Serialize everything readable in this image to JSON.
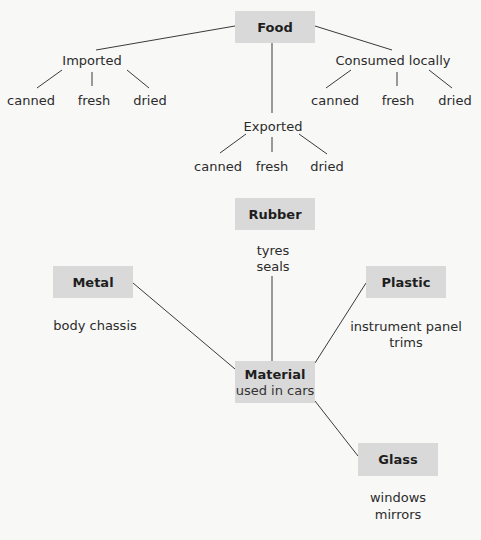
{
  "food_tree": {
    "root": "Food",
    "branches": [
      {
        "label": "Imported",
        "children": [
          "canned",
          "fresh",
          "dried"
        ]
      },
      {
        "label": "Exported",
        "children": [
          "canned",
          "fresh",
          "dried"
        ]
      },
      {
        "label": "Consumed locally",
        "children": [
          "canned",
          "fresh",
          "dried"
        ]
      }
    ]
  },
  "materials_map": {
    "center": {
      "title": "Material",
      "subtitle": "used in cars"
    },
    "nodes": [
      {
        "title": "Rubber",
        "items": [
          "tyres",
          "seals"
        ]
      },
      {
        "title": "Metal",
        "items": [
          "body chassis"
        ]
      },
      {
        "title": "Plastic",
        "items": [
          "instrument panel",
          "trims"
        ]
      },
      {
        "title": "Glass",
        "items": [
          "windows",
          "mirrors"
        ]
      }
    ]
  },
  "colors": {
    "box_fill": "#d9d9d9",
    "line": "#3a3a3a",
    "background": "#f8f8f7"
  }
}
